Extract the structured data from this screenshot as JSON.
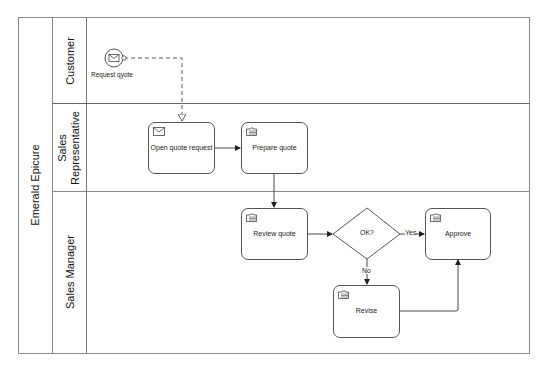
{
  "diagram": {
    "type": "bpmn-collaboration",
    "pool": {
      "label": "Emerald Epicure"
    },
    "lanes": [
      {
        "id": "customer",
        "label": "Customer"
      },
      {
        "id": "sales_rep",
        "label_line1": "Sales",
        "label_line2": "Representative"
      },
      {
        "id": "sales_manager",
        "label": "Sales Manager"
      }
    ],
    "start_event": {
      "label": "Request qyote",
      "icon": "envelope-icon",
      "lane": "customer"
    },
    "tasks": [
      {
        "id": "open_quote_request",
        "label": "Open quote request",
        "icon": "envelope-icon",
        "lane": "sales_rep"
      },
      {
        "id": "prepare_quote",
        "label": "Prepare quote",
        "icon": "manual-task-icon",
        "lane": "sales_rep"
      },
      {
        "id": "review_quote",
        "label": "Review quote",
        "icon": "manual-task-icon",
        "lane": "sales_manager"
      },
      {
        "id": "approve",
        "label": "Approve",
        "icon": "manual-task-icon",
        "lane": "sales_manager"
      },
      {
        "id": "revise",
        "label": "Revise",
        "icon": "manual-task-icon",
        "lane": "sales_manager"
      }
    ],
    "gateway": {
      "id": "ok_gateway",
      "label": "OK?",
      "lane": "sales_manager"
    },
    "flows": [
      {
        "from": "start_event",
        "to": "open_quote_request",
        "type": "message",
        "label": ""
      },
      {
        "from": "open_quote_request",
        "to": "prepare_quote",
        "type": "sequence",
        "label": ""
      },
      {
        "from": "prepare_quote",
        "to": "review_quote",
        "type": "sequence",
        "label": ""
      },
      {
        "from": "review_quote",
        "to": "ok_gateway",
        "type": "sequence",
        "label": ""
      },
      {
        "from": "ok_gateway",
        "to": "approve",
        "type": "sequence",
        "label": "Yes"
      },
      {
        "from": "ok_gateway",
        "to": "revise",
        "type": "sequence",
        "label": "No"
      },
      {
        "from": "revise",
        "to": "approve",
        "type": "sequence",
        "label": ""
      }
    ],
    "colors": {
      "line": "#555555",
      "border": "#888888",
      "background": "#ffffff",
      "text": "#222222"
    }
  }
}
